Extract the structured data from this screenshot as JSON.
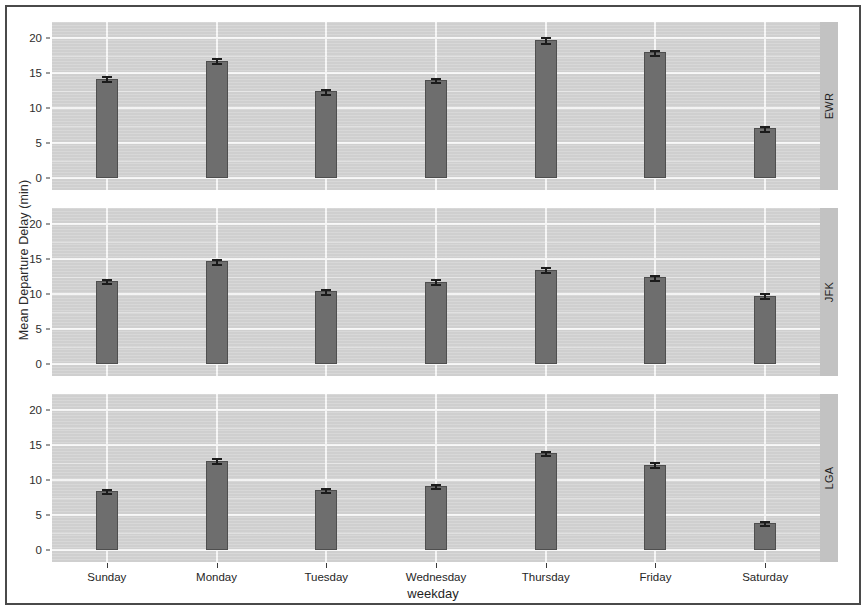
{
  "chart_data": {
    "type": "bar",
    "title": "",
    "subtitle": "",
    "xlabel": "weekday",
    "ylabel": "Mean Departure Delay (min)",
    "ylim": [
      0,
      21.5
    ],
    "yticks": [
      0,
      5,
      10,
      15,
      20
    ],
    "grid": true,
    "legend": null,
    "facet_variable": "origin",
    "facet_position": "right",
    "error_bars": "standard error",
    "categories": [
      "Sunday",
      "Monday",
      "Tuesday",
      "Wednesday",
      "Thursday",
      "Friday",
      "Saturday"
    ],
    "panels": [
      {
        "label": "EWR",
        "values": [
          14.2,
          16.8,
          12.4,
          14.0,
          19.8,
          18.0,
          7.1
        ],
        "errors": [
          0.35,
          0.35,
          0.3,
          0.3,
          0.4,
          0.35,
          0.3
        ]
      },
      {
        "label": "JFK",
        "values": [
          11.9,
          14.7,
          10.4,
          11.8,
          13.5,
          12.4,
          9.8
        ],
        "errors": [
          0.35,
          0.4,
          0.3,
          0.35,
          0.35,
          0.35,
          0.35
        ]
      },
      {
        "label": "LGA",
        "values": [
          8.5,
          12.8,
          8.6,
          9.2,
          13.9,
          12.2,
          3.9
        ],
        "errors": [
          0.3,
          0.4,
          0.3,
          0.3,
          0.35,
          0.35,
          0.3
        ]
      }
    ],
    "colors": {
      "bar_fill": "#6e6e6e",
      "bar_outline": "#4f4f4f",
      "panel_background": "#d2d2d2",
      "gridline": "#f7f7f7",
      "strip_background": "#c2c2c2",
      "error_bar": "#1c1c1c",
      "text": "#262626",
      "frame": "#4a4a4a"
    }
  }
}
